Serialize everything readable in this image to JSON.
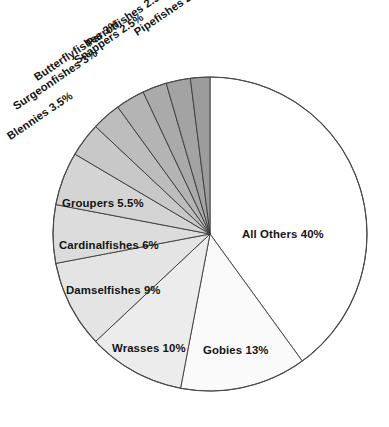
{
  "title": "",
  "chart_data": {
    "type": "pie",
    "title": "",
    "subtitle": "",
    "xlabel": "",
    "ylabel": "",
    "grid": false,
    "legend_position": "none",
    "units": "percent",
    "total": 100,
    "labels_format": "{name} {value}%",
    "categories": [
      "All Others",
      "Gobies",
      "Wrasses",
      "Damselfishes",
      "Cardinalfishes",
      "Groupers",
      "Blennies",
      "Surgeonfishes",
      "Butterflyfishes",
      "Snappers",
      "Parrotfishes",
      "Pipefishes"
    ],
    "values": [
      40,
      13,
      10,
      9,
      6,
      5.5,
      3.5,
      3,
      3,
      2.5,
      2.5,
      2
    ],
    "slices": [
      {
        "name": "All Others",
        "value": 40,
        "label": "All Others 40%",
        "color": "#ffffff",
        "start_deg": 0,
        "end_deg": 144,
        "label_x": 242,
        "label_y": 228,
        "rotation": 0,
        "placement": "inside"
      },
      {
        "name": "Gobies",
        "value": 13,
        "label": "Gobies 13%",
        "color": "#fafafa",
        "start_deg": 144,
        "end_deg": 190.8,
        "label_x": 203,
        "label_y": 344,
        "rotation": 0,
        "placement": "inside"
      },
      {
        "name": "Wrasses",
        "value": 10,
        "label": "Wrasses 10%",
        "color": "#ececec",
        "start_deg": 190.8,
        "end_deg": 226.8,
        "label_x": 112,
        "label_y": 342,
        "rotation": 0,
        "placement": "inside"
      },
      {
        "name": "Damselfishes",
        "value": 9,
        "label": "Damselfishes 9%",
        "color": "#e4e4e4",
        "start_deg": 226.8,
        "end_deg": 259.2,
        "label_x": 66,
        "label_y": 284,
        "rotation": 0,
        "placement": "inside"
      },
      {
        "name": "Cardinalfishes",
        "value": 6,
        "label": "Cardinalfishes 6%",
        "color": "#dcdcdc",
        "start_deg": 259.2,
        "end_deg": 280.8,
        "label_x": 59,
        "label_y": 239,
        "rotation": 0,
        "placement": "inside"
      },
      {
        "name": "Groupers",
        "value": 5.5,
        "label": "Groupers 5.5%",
        "color": "#d4d4d4",
        "start_deg": 280.8,
        "end_deg": 300.6,
        "label_x": 62,
        "label_y": 197,
        "rotation": 0,
        "placement": "inside"
      },
      {
        "name": "Blennies",
        "value": 3.5,
        "label": "Blennies 3.5%",
        "color": "#c8c8c8",
        "start_deg": 300.6,
        "end_deg": 313.2,
        "label_x": 8,
        "label_y": 131,
        "rotation": -34,
        "placement": "outside"
      },
      {
        "name": "Surgeonfishes",
        "value": 3,
        "label": "Surgeonfishes 3%",
        "color": "#bdbdbd",
        "start_deg": 313.2,
        "end_deg": 324,
        "label_x": 14,
        "label_y": 101,
        "rotation": -34,
        "placement": "outside"
      },
      {
        "name": "Butterflyfishes",
        "value": 3,
        "label": "Butterflyfishes 3%",
        "color": "#b4b4b4",
        "start_deg": 324,
        "end_deg": 334.8,
        "label_x": 35,
        "label_y": 72,
        "rotation": -34,
        "placement": "outside"
      },
      {
        "name": "Snappers",
        "value": 2.5,
        "label": "Snappers 2.5%",
        "color": "#aaaaaa",
        "start_deg": 334.8,
        "end_deg": 343.8,
        "label_x": 75,
        "label_y": 55,
        "rotation": -34,
        "placement": "outside"
      },
      {
        "name": "Parrotfishes",
        "value": 2.5,
        "label": "Parrotfishes 2.5%",
        "color": "#a3a3a3",
        "start_deg": 343.8,
        "end_deg": 352.8,
        "label_x": 87,
        "label_y": 38,
        "rotation": -34,
        "placement": "outside"
      },
      {
        "name": "Pipefishes",
        "value": 2,
        "label": "Pipefishes 2%",
        "color": "#9c9c9c",
        "start_deg": 352.8,
        "end_deg": 360,
        "label_x": 135,
        "label_y": 27,
        "rotation": -34,
        "placement": "outside"
      }
    ],
    "geometry": {
      "center_x": 210,
      "center_y": 234,
      "radius": 157,
      "start_angle_deg": 0,
      "direction": "clockwise"
    },
    "colors": {
      "stroke": "#3a3a3a",
      "outline": "#4a4a4a",
      "background": "#ffffff",
      "text": "#141414"
    }
  }
}
